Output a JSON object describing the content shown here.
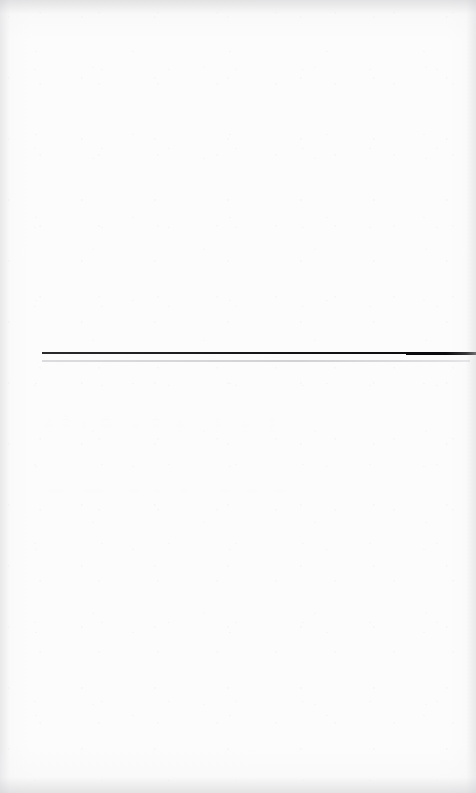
{
  "page": {
    "kind": "scanned-document-page",
    "width": 476,
    "height": 793,
    "background_color": "#fcfcfc",
    "content_summary": "Nearly blank scanned page: one dark horizontal rule, one lighter parallel rule below it, and two lines of severely faded text that are not legible.",
    "edge_shading": "subtle gray vignette along all four borders"
  },
  "rules": {
    "primary": {
      "label": "",
      "color": "#141416",
      "x_start": 42,
      "x_end": 476,
      "y": 352,
      "thickness": 2,
      "note": "spans to the right page edge; reads slightly heavier at its right end"
    },
    "secondary": {
      "label": "",
      "color": "#d8d8da",
      "x_start": 42,
      "x_end": 470,
      "y": 360,
      "thickness": 2,
      "note": "parallel to the dark rule, 8 px below it"
    }
  },
  "faded_text": {
    "heading": {
      "text": "",
      "legible": false,
      "reason": "ink faded to near-white; glyph shapes not resolvable at maximum zoom",
      "ink_color": "#fdfdfd",
      "x_start": 40,
      "x_end": 285,
      "y_top": 405,
      "y_bottom": 437,
      "approx_glyph_height": 30
    },
    "subline": {
      "text": "",
      "legible": false,
      "reason": "ink faded to near-white; glyph shapes not resolvable at maximum zoom",
      "ink_color": "#fdfdfd",
      "x_start": 42,
      "x_end": 300,
      "y_top": 485,
      "y_bottom": 495,
      "approx_glyph_height": 10
    }
  }
}
